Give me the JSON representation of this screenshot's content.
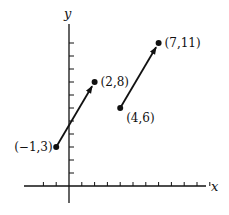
{
  "diagram": {
    "type": "coordinate-plane-vectors",
    "axes": {
      "x_label": "x",
      "y_label": "y",
      "x_ticks": [
        -2,
        -1,
        1,
        2,
        3,
        4,
        5,
        6,
        7,
        8,
        9,
        10,
        11
      ],
      "y_ticks": [
        1,
        2,
        3,
        4,
        5,
        6,
        7,
        8,
        9,
        10,
        11
      ]
    },
    "vectors": [
      {
        "from": [
          -1,
          3
        ],
        "to": [
          2,
          8
        ],
        "from_label": "(−1,3)",
        "to_label": "(2,8)"
      },
      {
        "from": [
          4,
          6
        ],
        "to": [
          7,
          11
        ],
        "from_label": "(4,6)",
        "to_label": "(7,11)"
      }
    ],
    "colors": {
      "ink": "#111111",
      "background": "#ffffff"
    }
  }
}
